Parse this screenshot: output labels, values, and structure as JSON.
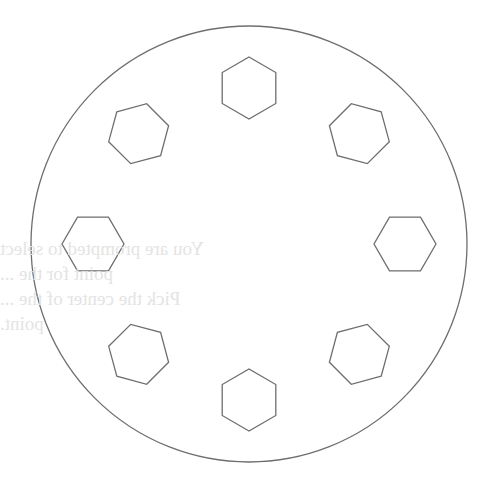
{
  "diagram": {
    "title": "",
    "stroke_color": "#6e6e6e",
    "background": "#ffffff",
    "outer_circle": {
      "cx": 249,
      "cy": 244,
      "r": 218
    },
    "bolt_circle_radius": 156,
    "hexagon_radius": 31,
    "hexagons": [
      {
        "name": "hex-top",
        "angle_deg": -90
      },
      {
        "name": "hex-top-right",
        "angle_deg": -45
      },
      {
        "name": "hex-right",
        "angle_deg": 0
      },
      {
        "name": "hex-bottom-right",
        "angle_deg": 45
      },
      {
        "name": "hex-bottom",
        "angle_deg": 90
      },
      {
        "name": "hex-bottom-left",
        "angle_deg": 135
      },
      {
        "name": "hex-left",
        "angle_deg": 180
      },
      {
        "name": "hex-top-left",
        "angle_deg": 225
      }
    ],
    "bleed_through_text": {
      "lines": [
        "You are prompted to select",
        "point for the ...",
        "Pick the center of the ...",
        "point."
      ],
      "color": "#e4e4e4",
      "mirrored": true
    }
  }
}
